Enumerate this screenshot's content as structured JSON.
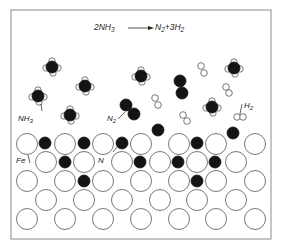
{
  "figure": {
    "equation": {
      "lhs": "2NH",
      "lhs_sub": "3",
      "rhs_n": "N",
      "rhs_n_sub": "2",
      "rhs_h": "+3H",
      "rhs_h_sub": "2"
    },
    "labels": {
      "nh3": {
        "main": "NH",
        "sub": "3"
      },
      "n2": {
        "main": "N",
        "sub": "2"
      },
      "h2": {
        "main": "H",
        "sub": "2"
      },
      "fe": "Fe",
      "n": "N"
    },
    "colors": {
      "border": "#8a8a8a",
      "atom_dark": "#141414",
      "atom_light": "#ffffff",
      "stroke": "#555555"
    },
    "nh3_molecules": [
      {
        "x": 52,
        "y": 67
      },
      {
        "x": 85,
        "y": 86
      },
      {
        "x": 38,
        "y": 96
      },
      {
        "x": 70,
        "y": 115
      },
      {
        "x": 141,
        "y": 76
      },
      {
        "x": 234,
        "y": 68
      },
      {
        "x": 212,
        "y": 107
      }
    ],
    "n2_molecules": [
      {
        "x1": 126,
        "y1": 105,
        "x2": 134,
        "y2": 114
      },
      {
        "x1": 180,
        "y1": 81,
        "x2": 182,
        "y2": 93
      }
    ],
    "h2_molecules": [
      {
        "x1": 201,
        "y1": 66,
        "x2": 204,
        "y2": 73
      },
      {
        "x1": 155,
        "y1": 98,
        "x2": 158,
        "y2": 105
      },
      {
        "x1": 226,
        "y1": 87,
        "x2": 229,
        "y2": 93
      },
      {
        "x1": 183,
        "y1": 115,
        "x2": 187,
        "y2": 121
      },
      {
        "x1": 237,
        "y1": 117,
        "x2": 243,
        "y2": 117
      }
    ],
    "fe_lattice_rows": [
      {
        "y": 144,
        "xs": [
          27,
          65,
          103,
          141,
          179,
          216,
          255
        ]
      },
      {
        "y": 162,
        "xs": [
          46,
          84,
          122,
          160,
          197,
          236
        ]
      },
      {
        "y": 181,
        "xs": [
          27,
          65,
          103,
          141,
          179,
          216,
          255
        ]
      },
      {
        "y": 200,
        "xs": [
          46,
          84,
          122,
          160,
          197,
          236
        ]
      },
      {
        "y": 219,
        "xs": [
          27,
          65,
          103,
          141,
          179,
          216,
          255
        ]
      }
    ],
    "adsorbed_n_atoms": [
      {
        "x": 45,
        "y": 143
      },
      {
        "x": 84,
        "y": 143
      },
      {
        "x": 122,
        "y": 143
      },
      {
        "x": 197,
        "y": 143
      },
      {
        "x": 158,
        "y": 130
      },
      {
        "x": 233,
        "y": 133
      },
      {
        "x": 65,
        "y": 162
      },
      {
        "x": 140,
        "y": 162
      },
      {
        "x": 178,
        "y": 162
      },
      {
        "x": 215,
        "y": 162
      },
      {
        "x": 84,
        "y": 181
      },
      {
        "x": 197,
        "y": 181
      }
    ]
  }
}
